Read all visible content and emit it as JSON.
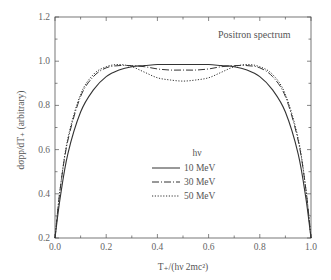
{
  "chart_data": {
    "type": "line",
    "title": "",
    "annotation": "Positron spectrum",
    "xlabel": "T₊/(hν  2mc²)",
    "ylabel": "dσpp/dT₊ (arbitrary)",
    "xlim": [
      0.0,
      1.0
    ],
    "ylim": [
      0.2,
      1.2
    ],
    "xticks": [
      "0.0",
      "0.2",
      "0.4",
      "0.6",
      "0.8",
      "1.0"
    ],
    "yticks": [
      "0.2",
      "0.4",
      "0.6",
      "0.8",
      "1.0",
      "1.2"
    ],
    "grid": false,
    "legend": {
      "title": "hν",
      "position": "center",
      "entries": [
        "10 MeV",
        "30 MeV",
        "50 MeV"
      ]
    },
    "x": [
      0.0,
      0.02,
      0.05,
      0.1,
      0.15,
      0.2,
      0.25,
      0.3,
      0.35,
      0.4,
      0.45,
      0.5,
      0.55,
      0.6,
      0.65,
      0.7,
      0.75,
      0.8,
      0.85,
      0.9,
      0.95,
      0.98,
      1.0
    ],
    "series": [
      {
        "name": "10 MeV",
        "style": "solid",
        "values": [
          0.2,
          0.38,
          0.58,
          0.77,
          0.87,
          0.93,
          0.96,
          0.975,
          0.98,
          0.985,
          0.985,
          0.985,
          0.985,
          0.985,
          0.98,
          0.975,
          0.96,
          0.93,
          0.87,
          0.77,
          0.58,
          0.38,
          0.2
        ]
      },
      {
        "name": "30 MeV",
        "style": "dash-dot",
        "values": [
          0.2,
          0.42,
          0.64,
          0.84,
          0.93,
          0.97,
          0.98,
          0.98,
          0.975,
          0.965,
          0.96,
          0.96,
          0.96,
          0.965,
          0.975,
          0.98,
          0.98,
          0.97,
          0.93,
          0.84,
          0.64,
          0.42,
          0.2
        ]
      },
      {
        "name": "50 MeV",
        "style": "dotted",
        "values": [
          0.2,
          0.42,
          0.65,
          0.85,
          0.94,
          0.975,
          0.985,
          0.975,
          0.95,
          0.925,
          0.915,
          0.91,
          0.915,
          0.925,
          0.95,
          0.975,
          0.985,
          0.975,
          0.94,
          0.85,
          0.65,
          0.42,
          0.2
        ]
      }
    ]
  }
}
